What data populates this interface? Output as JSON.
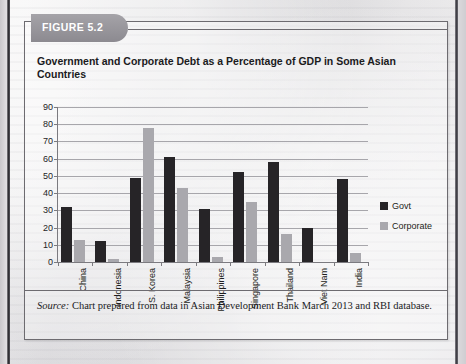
{
  "figure": {
    "tab_label": "FIGURE 5.2",
    "title": "Government and Corporate Debt as a Percentage of GDP in Some Asian Countries",
    "source_label": "Source:",
    "source_text": " Chart prepared from data in Asian Development Bank March 2013 and RBI database."
  },
  "colors": {
    "govt": "#262427",
    "corporate": "#a9a8ad",
    "tab_fill": "#8c8a90",
    "frame": "#6d6b70",
    "gridline": "#a7a6ab"
  },
  "chart_data": {
    "type": "bar",
    "title": "Government and Corporate Debt as a Percentage of GDP in Some Asian Countries",
    "xlabel": "",
    "ylabel": "",
    "ylim": [
      0,
      90
    ],
    "ytick_step": 10,
    "yticks": [
      0,
      10,
      20,
      30,
      40,
      50,
      60,
      70,
      80,
      90
    ],
    "grid": true,
    "legend_position": "right",
    "categories": [
      "China",
      "Indonesia",
      "S. Korea",
      "Malaysia",
      "Philippines",
      "Singapore",
      "Thailand",
      "Viet Nam",
      "India"
    ],
    "series": [
      {
        "name": "Govt",
        "color": "#262427",
        "values": [
          32,
          12,
          49,
          61,
          31,
          52,
          58,
          20,
          48
        ]
      },
      {
        "name": "Corporate",
        "color": "#a9a8ad",
        "values": [
          13,
          2,
          78,
          43,
          3,
          35,
          16,
          0,
          5
        ]
      }
    ]
  }
}
